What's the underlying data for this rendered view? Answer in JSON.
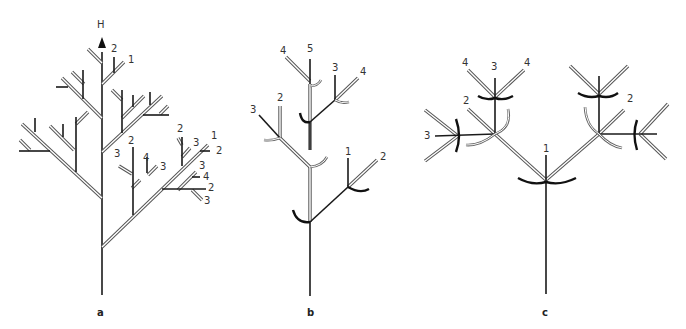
{
  "figure": {
    "panels": [
      {
        "id": "a",
        "label": "a",
        "axis_label": "H",
        "order_labels": [
          "2",
          "1",
          "2",
          "3",
          "1",
          "2",
          "2",
          "3",
          "4",
          "3",
          "3",
          "4",
          "2",
          "3"
        ]
      },
      {
        "id": "b",
        "label": "b",
        "order_labels": [
          "4",
          "5",
          "3",
          "4",
          "3",
          "2",
          "1",
          "2"
        ]
      },
      {
        "id": "c",
        "label": "c",
        "order_labels": [
          "4",
          "3",
          "4",
          "2",
          "3",
          "1",
          "2"
        ]
      }
    ]
  }
}
